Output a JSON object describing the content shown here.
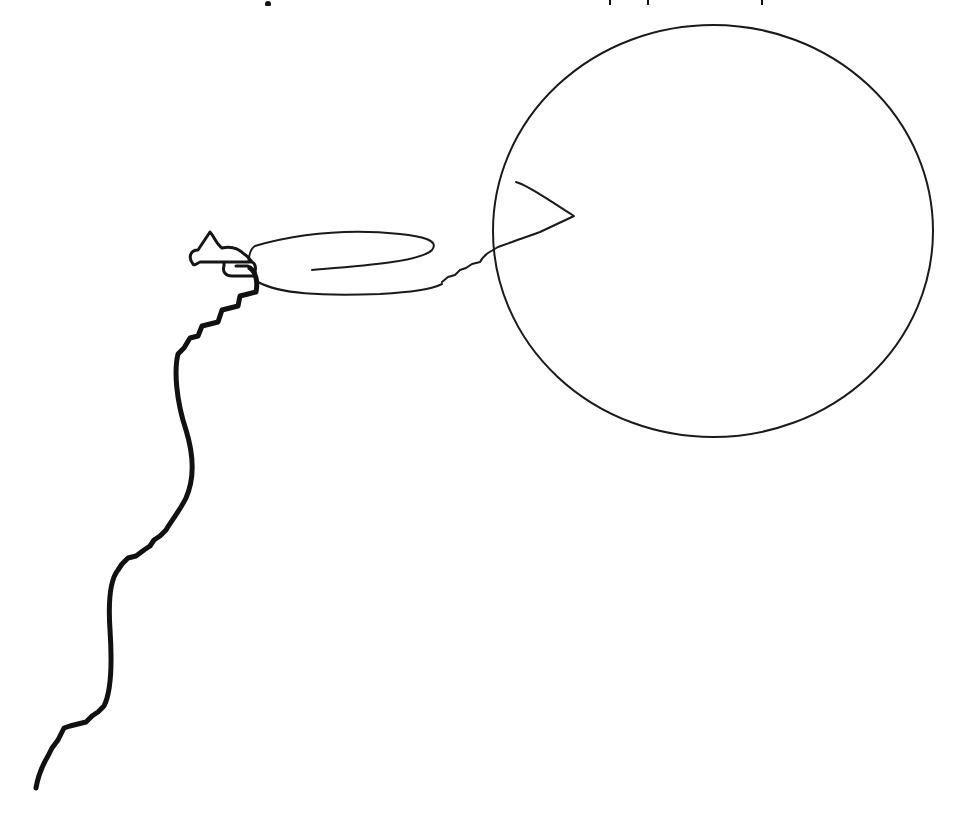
{
  "canvas": {
    "width": 962,
    "height": 827,
    "background": "#ffffff",
    "stroke_color": "#111111"
  },
  "title": {
    "visible": false,
    "note": "",
    "descender_marks_x": [
      268,
      610,
      648,
      762
    ]
  },
  "drawing": {
    "elements": [
      {
        "name": "large-circle",
        "type": "ellipse",
        "cx": 713,
        "cy": 231,
        "rx": 220,
        "ry": 206
      },
      {
        "name": "elongated-loop",
        "type": "freehand-loop"
      },
      {
        "name": "arrow-tail-squiggle",
        "type": "freehand-line"
      },
      {
        "name": "small-blob",
        "type": "freehand-shape"
      },
      {
        "name": "wavy-path",
        "type": "freehand-line-thick"
      }
    ]
  }
}
